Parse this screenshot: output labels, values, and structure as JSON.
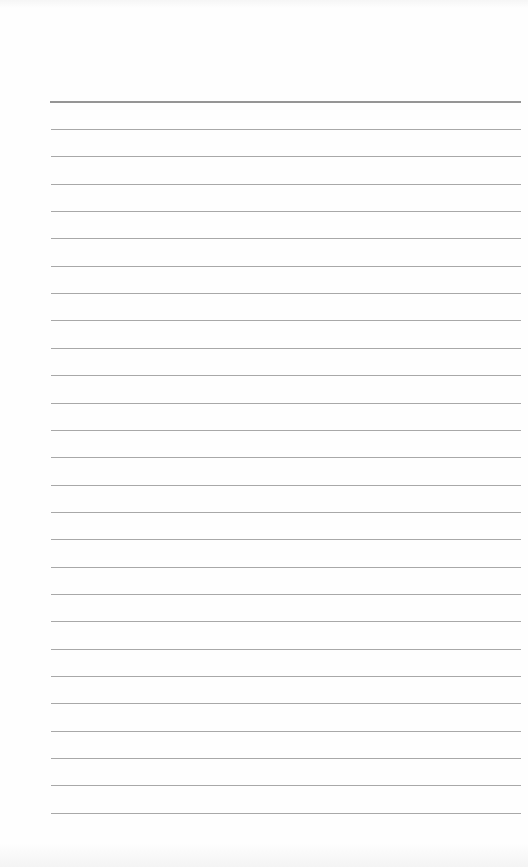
{
  "page": {
    "type": "lined-paper",
    "background_color": "#ffffff",
    "header_rule": {
      "y": 101,
      "thickness": 2,
      "color": "#959595"
    },
    "rules": {
      "count": 26,
      "first_y": 129,
      "spacing": 27.35,
      "left": 51,
      "right": 521,
      "thickness": 1,
      "color": "#a8a8a8"
    }
  }
}
